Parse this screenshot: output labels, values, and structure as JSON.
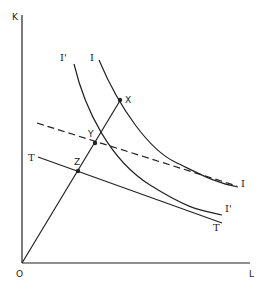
{
  "diagram": {
    "axes": {
      "y_label": "K",
      "x_label": "L",
      "origin_label": "O"
    },
    "curves": [
      {
        "id": "isoquant-I",
        "label_top": "I",
        "label_end": "I",
        "style": "solid"
      },
      {
        "id": "isoquant-I-prime",
        "label_top": "I'",
        "label_end": "I'",
        "style": "solid"
      },
      {
        "id": "isocost-dashed",
        "style": "dashed"
      },
      {
        "id": "isocost-T",
        "label_start": "T",
        "label_end": "T",
        "style": "solid"
      },
      {
        "id": "expansion-ray",
        "style": "solid"
      }
    ],
    "points": [
      {
        "label": "X",
        "on": "isoquant-I"
      },
      {
        "label": "Y",
        "on": "isoquant-I-prime / dashed isocost"
      },
      {
        "label": "Z",
        "on": "isocost-T"
      }
    ],
    "colors": {
      "ink": "#222222",
      "background": "#ffffff"
    }
  }
}
